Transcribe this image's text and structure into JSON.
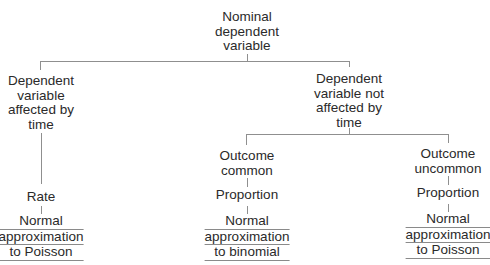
{
  "diagram": {
    "type": "decision-tree",
    "root": {
      "label_lines": [
        "Nominal",
        "dependent",
        "variable"
      ]
    },
    "level1": [
      {
        "id": "affected",
        "label_lines": [
          "Dependent",
          "variable",
          "affected by",
          "time"
        ]
      },
      {
        "id": "not-affected",
        "label_lines": [
          "Dependent",
          "variable not",
          "affected by",
          "time"
        ]
      }
    ],
    "level2": [
      {
        "id": "outcome-common",
        "parent": "not-affected",
        "label_lines": [
          "Outcome",
          "common"
        ]
      },
      {
        "id": "outcome-uncommon",
        "parent": "not-affected",
        "label_lines": [
          "Outcome",
          "uncommon"
        ]
      }
    ],
    "measures": [
      {
        "id": "rate",
        "parent": "affected",
        "label": "Rate"
      },
      {
        "id": "proportion-common",
        "parent": "outcome-common",
        "label": "Proportion"
      },
      {
        "id": "proportion-uncommon",
        "parent": "outcome-uncommon",
        "label": "Proportion"
      }
    ],
    "methods": [
      {
        "id": "method-rate",
        "parent": "rate",
        "label_lines": [
          "Normal",
          "approximation",
          "to Poisson"
        ]
      },
      {
        "id": "method-common",
        "parent": "proportion-common",
        "label_lines": [
          "Normal",
          "approximation",
          "to binomial"
        ]
      },
      {
        "id": "method-uncommon",
        "parent": "proportion-uncommon",
        "label_lines": [
          "Normal",
          "approximation",
          "to Poisson"
        ]
      }
    ]
  }
}
